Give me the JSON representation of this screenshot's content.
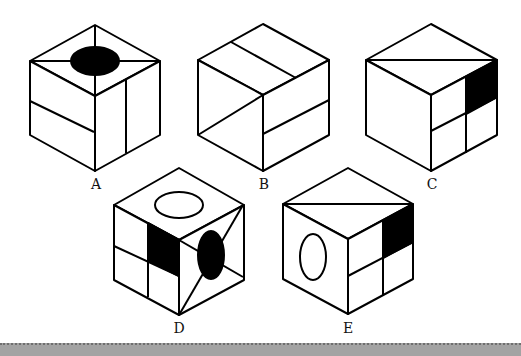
{
  "figure": {
    "colors": {
      "line": "#000000",
      "fill_dark": "#000000",
      "fill_light": "#ffffff",
      "footer": "#a3a3a3"
    }
  },
  "cubes": [
    {
      "label": "A",
      "top_face": "cross lines with black ellipse",
      "left_face": "one horizontal divider",
      "right_face": "one vertical divider"
    },
    {
      "label": "B",
      "top_face": "one divider line",
      "left_face": "diagonal line",
      "right_face": "one horizontal divider"
    },
    {
      "label": "C",
      "top_face": "diagonal line",
      "left_face": "blank",
      "right_face": "four quadrants, upper-right black"
    },
    {
      "label": "D",
      "top_face": "white ellipse",
      "left_face": "four quadrants, upper-right black",
      "right_face": "diagonal lines with black ellipse"
    },
    {
      "label": "E",
      "top_face": "diagonal line",
      "left_face": "white ellipse",
      "right_face": "four quadrants, upper-right black"
    }
  ]
}
